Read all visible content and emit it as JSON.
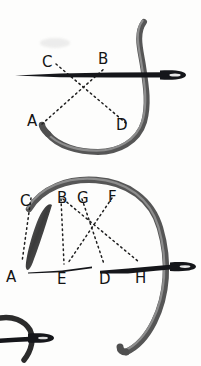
{
  "page": {
    "background_color": "#fdfdfc",
    "ink_color": "#141414",
    "thread_color": "#4a4a4a",
    "thread_shade_color": "#6e6e6e",
    "dotted_color": "#2a2a2a",
    "width": 201,
    "height": 366
  },
  "figures": [
    {
      "name": "upper-figure",
      "labels": [
        {
          "id": "C",
          "text": "C",
          "x": 42,
          "y": 55
        },
        {
          "id": "B",
          "text": "B",
          "x": 98,
          "y": 52
        },
        {
          "id": "A",
          "text": "A",
          "x": 27,
          "y": 114
        },
        {
          "id": "D",
          "text": "D",
          "x": 116,
          "y": 118
        }
      ],
      "dotted_paths": [
        {
          "name": "C-to-D",
          "from": "C",
          "to": "D"
        },
        {
          "name": "A-to-B",
          "from": "A",
          "to": "B"
        }
      ],
      "needles": [
        {
          "name": "upper-needle",
          "orientation": "horizontal",
          "eye": "right"
        }
      ],
      "threads": [
        {
          "name": "upper-thread-loop",
          "shape": "s-curve-with-u-loop"
        }
      ]
    },
    {
      "name": "lower-figure",
      "labels": [
        {
          "id": "C",
          "text": "C",
          "x": 20,
          "y": 194
        },
        {
          "id": "B",
          "text": "B",
          "x": 57,
          "y": 191
        },
        {
          "id": "G",
          "text": "G",
          "x": 77,
          "y": 191
        },
        {
          "id": "F",
          "text": "F",
          "x": 108,
          "y": 190
        },
        {
          "id": "A",
          "text": "A",
          "x": 6,
          "y": 270
        },
        {
          "id": "E",
          "text": "E",
          "x": 57,
          "y": 272
        },
        {
          "id": "D",
          "text": "D",
          "x": 99,
          "y": 272
        },
        {
          "id": "H",
          "text": "H",
          "x": 135,
          "y": 271
        }
      ],
      "dotted_paths": [
        {
          "name": "C-to-A",
          "from": "C",
          "to": "A"
        },
        {
          "name": "B-to-E",
          "from": "B",
          "to": "E"
        },
        {
          "name": "G-to-D",
          "from": "G",
          "to": "D"
        },
        {
          "name": "F-to-H",
          "from": "F",
          "to": "H"
        },
        {
          "name": "B-to-H",
          "from": "B",
          "to": "H"
        }
      ],
      "needles": [
        {
          "name": "lower-needle",
          "orientation": "horizontal",
          "eye": "right"
        },
        {
          "name": "thin-guide-line",
          "orientation": "horizontal",
          "eye": "none"
        }
      ],
      "threads": [
        {
          "name": "lower-thread-arc",
          "shape": "large-arc"
        },
        {
          "name": "slanted-stitch",
          "shape": "short-diagonal"
        }
      ]
    },
    {
      "name": "bottom-fragment-figure",
      "labels": [],
      "needles": [
        {
          "name": "fragment-needle",
          "orientation": "horizontal",
          "eye": "right"
        }
      ],
      "threads": [
        {
          "name": "fragment-thread",
          "shape": "hook-curve"
        }
      ]
    }
  ]
}
